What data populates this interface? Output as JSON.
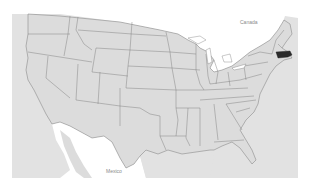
{
  "map": {
    "title": "United States map",
    "labels": {
      "canada": "Canada",
      "mexico": "Mexico"
    },
    "highlighted_state": "Massachusetts",
    "colors": {
      "page_background": "#ffffff",
      "land": "#dcdcdc",
      "ocean_tint": "#e3e3e3",
      "state_border": "#7a7a7a",
      "highlight": "#2b2b2b",
      "label_text": "#8a8a8a"
    }
  }
}
